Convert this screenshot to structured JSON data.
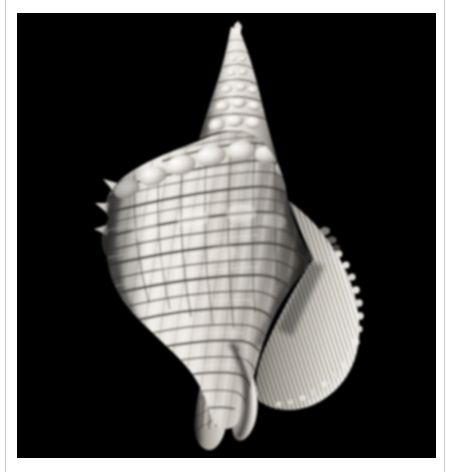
{
  "page": {
    "background_color": "#ffffff",
    "rule_color": "#c9c9c9"
  },
  "plate": {
    "name": "shell-photograph",
    "background_color": "#000000",
    "left": 17,
    "top": 13,
    "width": 419,
    "height": 445
  },
  "subject": {
    "label": "seashell",
    "description": "Monochrome studio photograph of a spiral gastropod sea shell on a pure black background",
    "orientation": "apex-up, aperture facing right",
    "parts": [
      {
        "name": "apex",
        "label": "apex"
      },
      {
        "name": "spire",
        "label": "spire"
      },
      {
        "name": "shoulder-nodules",
        "label": "shoulder nodules"
      },
      {
        "name": "body-whorl",
        "label": "body whorl"
      },
      {
        "name": "aperture-lip",
        "label": "flared aperture lip"
      },
      {
        "name": "siphonal-canal",
        "label": "siphonal canal"
      }
    ],
    "tones": {
      "highlight": "#f5f3ef",
      "midtone": "#bdb9b2",
      "shadow": "#4a4741",
      "deep_shadow": "#1c1a18",
      "banding": "#5b5752"
    }
  }
}
